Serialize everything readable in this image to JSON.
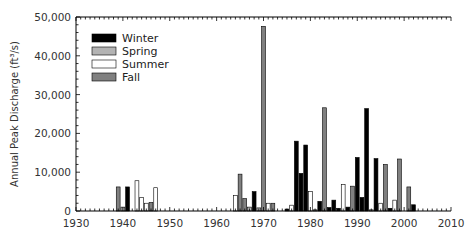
{
  "chart_data": {
    "type": "bar",
    "title": "",
    "xlabel": "",
    "ylabel": "Annual Peak Discharge (ft³/s)",
    "xlim": [
      1930,
      2010
    ],
    "ylim": [
      0,
      50000
    ],
    "x_ticks": [
      "1930",
      "1940",
      "1950",
      "1960",
      "1970",
      "1980",
      "1990",
      "2000",
      "2010"
    ],
    "y_ticks": [
      "0",
      "10,000",
      "20,000",
      "30,000",
      "40,000",
      "50,000"
    ],
    "grid": false,
    "legend_position": "upper-left",
    "legend": [
      {
        "name": "Winter",
        "color": "#000000"
      },
      {
        "name": "Spring",
        "color": "#b3b3b3"
      },
      {
        "name": "Summer",
        "color": "#ffffff"
      },
      {
        "name": "Fall",
        "color": "#808080"
      }
    ],
    "bars": [
      {
        "year": 1939,
        "season": "Fall",
        "value": 6200
      },
      {
        "year": 1940,
        "season": "Spring",
        "value": 1000
      },
      {
        "year": 1941,
        "season": "Winter",
        "value": 6200
      },
      {
        "year": 1943,
        "season": "Summer",
        "value": 7800
      },
      {
        "year": 1944,
        "season": "Summer",
        "value": 3500
      },
      {
        "year": 1945,
        "season": "Summer",
        "value": 2000
      },
      {
        "year": 1946,
        "season": "Fall",
        "value": 2200
      },
      {
        "year": 1947,
        "season": "Summer",
        "value": 6000
      },
      {
        "year": 1964,
        "season": "Summer",
        "value": 4000
      },
      {
        "year": 1965,
        "season": "Fall",
        "value": 9500
      },
      {
        "year": 1966,
        "season": "Fall",
        "value": 3200
      },
      {
        "year": 1967,
        "season": "Spring",
        "value": 1000
      },
      {
        "year": 1968,
        "season": "Winter",
        "value": 5000
      },
      {
        "year": 1969,
        "season": "Spring",
        "value": 800
      },
      {
        "year": 1970,
        "season": "Fall",
        "value": 47600
      },
      {
        "year": 1971,
        "season": "Summer",
        "value": 2000
      },
      {
        "year": 1972,
        "season": "Fall",
        "value": 2000
      },
      {
        "year": 1975,
        "season": "Winter",
        "value": 500
      },
      {
        "year": 1976,
        "season": "Summer",
        "value": 1500
      },
      {
        "year": 1977,
        "season": "Winter",
        "value": 18000
      },
      {
        "year": 1978,
        "season": "Winter",
        "value": 9700
      },
      {
        "year": 1979,
        "season": "Winter",
        "value": 17000
      },
      {
        "year": 1980,
        "season": "Summer",
        "value": 5000
      },
      {
        "year": 1981,
        "season": "Spring",
        "value": 300
      },
      {
        "year": 1982,
        "season": "Winter",
        "value": 2500
      },
      {
        "year": 1983,
        "season": "Fall",
        "value": 26600
      },
      {
        "year": 1984,
        "season": "Winter",
        "value": 900
      },
      {
        "year": 1985,
        "season": "Winter",
        "value": 2800
      },
      {
        "year": 1986,
        "season": "Winter",
        "value": 700
      },
      {
        "year": 1987,
        "season": "Summer",
        "value": 6800
      },
      {
        "year": 1988,
        "season": "Winter",
        "value": 1000
      },
      {
        "year": 1989,
        "season": "Fall",
        "value": 6400
      },
      {
        "year": 1990,
        "season": "Winter",
        "value": 13800
      },
      {
        "year": 1991,
        "season": "Winter",
        "value": 3500
      },
      {
        "year": 1992,
        "season": "Winter",
        "value": 26400
      },
      {
        "year": 1993,
        "season": "Spring",
        "value": 300
      },
      {
        "year": 1994,
        "season": "Winter",
        "value": 13500
      },
      {
        "year": 1995,
        "season": "Summer",
        "value": 2000
      },
      {
        "year": 1996,
        "season": "Fall",
        "value": 12000
      },
      {
        "year": 1997,
        "season": "Winter",
        "value": 700
      },
      {
        "year": 1998,
        "season": "Summer",
        "value": 2800
      },
      {
        "year": 1999,
        "season": "Fall",
        "value": 13400
      },
      {
        "year": 2001,
        "season": "Fall",
        "value": 6200
      },
      {
        "year": 2002,
        "season": "Winter",
        "value": 1600
      }
    ]
  }
}
